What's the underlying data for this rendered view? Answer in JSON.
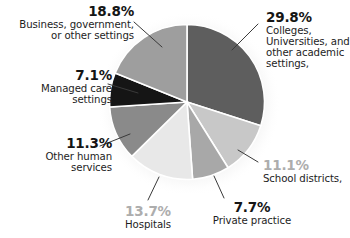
{
  "chart_data": {
    "type": "pie",
    "title": "",
    "subtitle": "",
    "xlabel": "",
    "ylabel": "",
    "legend_position": "callout-labels",
    "grid": false,
    "units": "percent",
    "start_angle_deg": 0,
    "direction": "clockwise",
    "categories": [
      "Colleges, Universities, and other academic settings,",
      "School districts,",
      "Private practice",
      "Hospitals",
      "Other human services",
      "Managed care settings",
      "Business, government, or other settings"
    ],
    "values": [
      29.8,
      11.1,
      7.7,
      13.7,
      11.3,
      7.1,
      18.8
    ],
    "slices": [
      {
        "id": "colleges",
        "percent_label": "29.8%",
        "value": 29.8,
        "label_lines": [
          "Colleges,",
          "Universities, and",
          "other academic",
          "settings,"
        ],
        "color": "#5e5e5e",
        "percent_color": "#151515"
      },
      {
        "id": "school-districts",
        "percent_label": "11.1%",
        "value": 11.1,
        "label_lines": [
          "School districts,"
        ],
        "color": "#c8c8c8",
        "percent_color": "#adadad"
      },
      {
        "id": "private-practice",
        "percent_label": "7.7%",
        "value": 7.7,
        "label_lines": [
          "Private practice"
        ],
        "color": "#a8a8a8",
        "percent_color": "#151515"
      },
      {
        "id": "hospitals",
        "percent_label": "13.7%",
        "value": 13.7,
        "label_lines": [
          "Hospitals"
        ],
        "color": "#e8e8e8",
        "percent_color": "#adadad"
      },
      {
        "id": "other-human-services",
        "percent_label": "11.3%",
        "value": 11.3,
        "label_lines": [
          "Other human",
          "services"
        ],
        "color": "#8a8a8a",
        "percent_color": "#151515"
      },
      {
        "id": "managed-care",
        "percent_label": "7.1%",
        "value": 7.1,
        "label_lines": [
          "Managed care",
          "settings"
        ],
        "color": "#151515",
        "percent_color": "#151515"
      },
      {
        "id": "business-government",
        "percent_label": "18.8%",
        "value": 18.8,
        "label_lines": [
          "Business, government,",
          "or other settings"
        ],
        "color": "#9e9e9e",
        "percent_color": "#151515"
      }
    ]
  },
  "labels": {
    "business": {
      "percent": "18.8%",
      "line1": "Business, government,",
      "line2": "or other settings"
    },
    "managed": {
      "percent": "7.1%",
      "line1": "Managed care",
      "line2": "settings"
    },
    "other_human": {
      "percent": "11.3%",
      "line1": "Other human",
      "line2": "services"
    },
    "hospitals": {
      "percent": "13.7%",
      "line1": "Hospitals"
    },
    "private": {
      "percent": "7.7%",
      "line1": "Private practice"
    },
    "school": {
      "percent": "11.1%",
      "line1": "School districts,"
    },
    "colleges": {
      "percent": "29.8%",
      "line1": "Colleges,",
      "line2": "Universities, and",
      "line3": "other academic",
      "line4": "settings,"
    }
  }
}
